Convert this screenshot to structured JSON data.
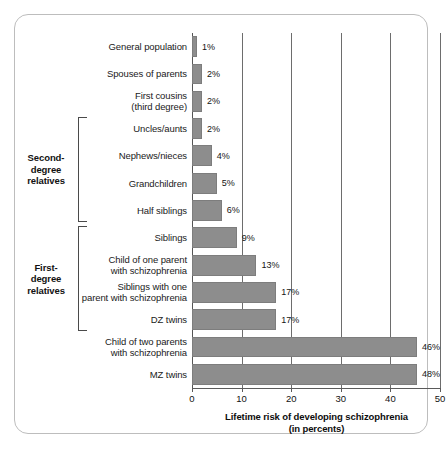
{
  "chart_data": {
    "type": "bar",
    "orientation": "horizontal",
    "title": "",
    "xlabel_line1": "Lifetime risk of developing schizophrenia",
    "xlabel_line2": "(in percents)",
    "ylabel": "",
    "xlim": [
      0,
      50
    ],
    "xticks": [
      0,
      10,
      20,
      30,
      40,
      50
    ],
    "xtick_labels": [
      "0",
      "10",
      "20",
      "30",
      "40",
      "50"
    ],
    "grid": true,
    "legend": null,
    "value_suffix": "%",
    "categories": [
      "General population",
      "Spouses of parents",
      "First cousins\n(third degree)",
      "Uncles/aunts",
      "Nephews/nieces",
      "Grandchildren",
      "Half siblings",
      "Siblings",
      "Child of one parent\nwith schizophrenia",
      "Siblings with one\nparent with schizophrenia",
      "DZ twins",
      "Child of two parents\nwith schizophrenia",
      "MZ twins"
    ],
    "values": [
      1,
      2,
      2,
      2,
      4,
      5,
      6,
      9,
      13,
      17,
      17,
      46,
      48
    ],
    "value_labels": [
      "1%",
      "2%",
      "2%",
      "2%",
      "4%",
      "5%",
      "6%",
      "9%",
      "13%",
      "17%",
      "17%",
      "46%",
      "48%"
    ],
    "groups": [
      {
        "title": "Second-\ndegree\nrelatives",
        "first_index": 3,
        "last_index": 6
      },
      {
        "title": "First-\ndegree\nrelatives",
        "first_index": 7,
        "last_index": 10
      }
    ],
    "colors": {
      "bar": "#8d8d8d",
      "grid": "#6d6d6d",
      "axis": "#5a5a5a",
      "text": "#1a1a1a",
      "frame": "#bdbdbd",
      "background": "#ffffff"
    }
  }
}
